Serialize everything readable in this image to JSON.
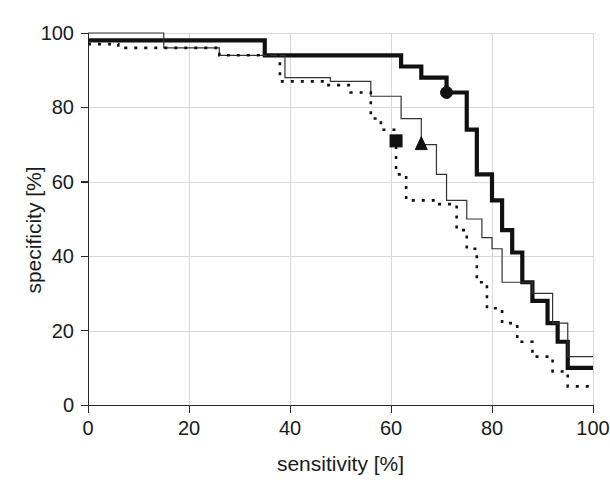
{
  "chart_data": {
    "type": "line",
    "title": "",
    "xlabel": "sensitivity [%]",
    "ylabel": "specificity [%]",
    "xlim": [
      0,
      100
    ],
    "ylim": [
      0,
      100
    ],
    "xticks": [
      0,
      20,
      40,
      60,
      80,
      100
    ],
    "yticks": [
      0,
      20,
      40,
      60,
      80,
      100
    ],
    "xtick_labels": [
      "0",
      "20",
      "40",
      "60",
      "80",
      "100"
    ],
    "ytick_labels": [
      "0",
      "20",
      "40",
      "60",
      "80",
      "100"
    ],
    "grid": true,
    "legend": "none",
    "drawstyle": "steps-post",
    "series": [
      {
        "name": "thick-solid-curve",
        "style": "solid",
        "linewidth": "thick",
        "color": "#111111",
        "marker": {
          "shape": "circle",
          "x": 71,
          "y": 84
        },
        "points": [
          [
            0,
            98
          ],
          [
            14,
            98
          ],
          [
            35,
            98
          ],
          [
            35,
            94
          ],
          [
            62,
            94
          ],
          [
            62,
            91
          ],
          [
            66,
            91
          ],
          [
            66,
            88
          ],
          [
            71,
            88
          ],
          [
            71,
            84
          ],
          [
            75,
            84
          ],
          [
            75,
            74
          ],
          [
            77,
            74
          ],
          [
            77,
            62
          ],
          [
            80,
            62
          ],
          [
            80,
            55
          ],
          [
            82,
            55
          ],
          [
            82,
            47
          ],
          [
            84,
            47
          ],
          [
            84,
            41
          ],
          [
            86,
            41
          ],
          [
            86,
            33
          ],
          [
            88,
            33
          ],
          [
            88,
            28
          ],
          [
            91,
            28
          ],
          [
            91,
            22
          ],
          [
            93,
            22
          ],
          [
            93,
            17
          ],
          [
            95,
            17
          ],
          [
            95,
            10
          ],
          [
            100,
            10
          ]
        ]
      },
      {
        "name": "thin-solid-curve",
        "style": "solid",
        "linewidth": "thin",
        "color": "#333333",
        "marker": {
          "shape": "triangle",
          "x": 66,
          "y": 70
        },
        "points": [
          [
            0,
            100
          ],
          [
            15,
            100
          ],
          [
            15,
            96
          ],
          [
            26,
            96
          ],
          [
            26,
            94
          ],
          [
            39,
            94
          ],
          [
            39,
            88
          ],
          [
            48,
            88
          ],
          [
            48,
            87
          ],
          [
            56,
            87
          ],
          [
            56,
            83
          ],
          [
            62,
            83
          ],
          [
            62,
            77
          ],
          [
            66,
            77
          ],
          [
            66,
            70
          ],
          [
            69,
            70
          ],
          [
            69,
            62
          ],
          [
            71,
            62
          ],
          [
            71,
            55
          ],
          [
            75,
            55
          ],
          [
            75,
            50
          ],
          [
            78,
            50
          ],
          [
            78,
            45
          ],
          [
            80,
            45
          ],
          [
            80,
            42
          ],
          [
            82,
            42
          ],
          [
            82,
            33
          ],
          [
            88,
            33
          ],
          [
            88,
            30
          ],
          [
            92,
            30
          ],
          [
            92,
            22
          ],
          [
            95,
            22
          ],
          [
            95,
            13
          ],
          [
            100,
            13
          ]
        ]
      },
      {
        "name": "dotted-curve",
        "style": "dotted",
        "linewidth": "medium",
        "color": "#111111",
        "marker": {
          "shape": "square",
          "x": 61,
          "y": 71
        },
        "points": [
          [
            0,
            97
          ],
          [
            6,
            97
          ],
          [
            6,
            96
          ],
          [
            26,
            96
          ],
          [
            26,
            94
          ],
          [
            38,
            94
          ],
          [
            38,
            87
          ],
          [
            47,
            87
          ],
          [
            47,
            86
          ],
          [
            52,
            86
          ],
          [
            52,
            84
          ],
          [
            56,
            84
          ],
          [
            56,
            77
          ],
          [
            58,
            77
          ],
          [
            58,
            74
          ],
          [
            61,
            74
          ],
          [
            61,
            71
          ],
          [
            61,
            62
          ],
          [
            63,
            62
          ],
          [
            63,
            55
          ],
          [
            69,
            55
          ],
          [
            69,
            54
          ],
          [
            73,
            54
          ],
          [
            73,
            47
          ],
          [
            75,
            47
          ],
          [
            75,
            42
          ],
          [
            77,
            42
          ],
          [
            77,
            33
          ],
          [
            79,
            33
          ],
          [
            79,
            26
          ],
          [
            82,
            26
          ],
          [
            82,
            22
          ],
          [
            85,
            22
          ],
          [
            85,
            17
          ],
          [
            88,
            17
          ],
          [
            88,
            13
          ],
          [
            92,
            13
          ],
          [
            92,
            9
          ],
          [
            95,
            9
          ],
          [
            95,
            5
          ],
          [
            100,
            5
          ]
        ]
      }
    ]
  },
  "axes": {
    "x_title": "sensitivity [%]",
    "y_title": "specificity [%]"
  }
}
